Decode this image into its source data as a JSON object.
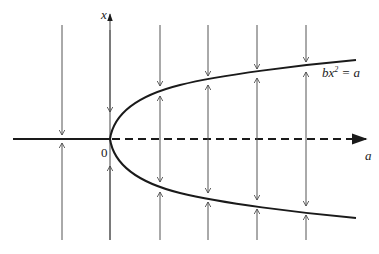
{
  "diagram": {
    "type": "bifurcation-phase-diagram",
    "axes": {
      "horizontal": {
        "label": "a",
        "origin_label": "0"
      },
      "vertical": {
        "label": "x"
      }
    },
    "curve": {
      "label_base": "bx",
      "label_exp": "2",
      "label_rest": " = a"
    },
    "colors": {
      "ink": "#1a1a1a",
      "flow": "#555555"
    },
    "flow_lines_x": [
      62,
      110,
      160,
      208,
      257,
      306
    ]
  }
}
